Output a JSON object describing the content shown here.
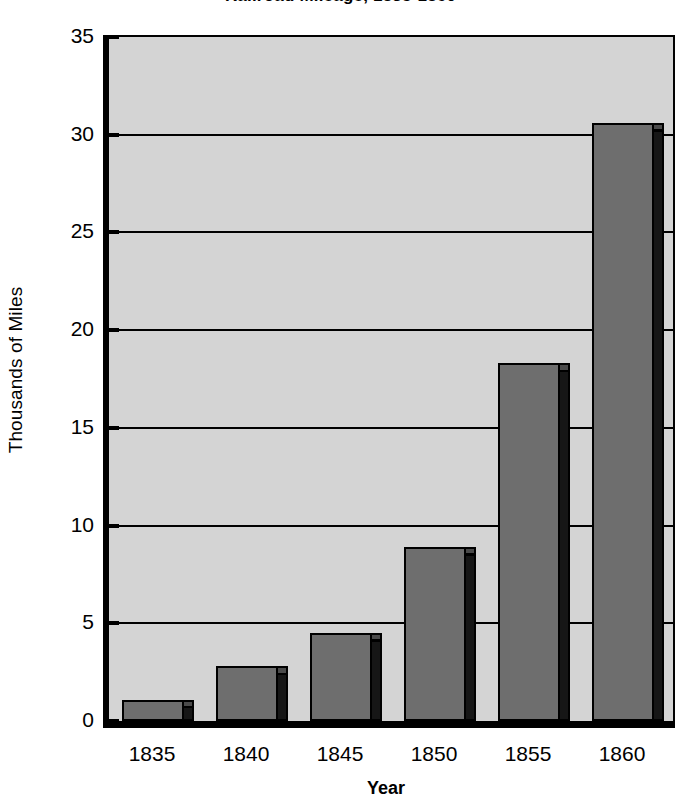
{
  "chart_data": {
    "type": "bar",
    "title": "Railroad Mileage, 1835-1860",
    "xlabel": "Year",
    "ylabel": "Thousands of Miles",
    "categories": [
      "1835",
      "1840",
      "1845",
      "1850",
      "1855",
      "1860"
    ],
    "values": [
      1.1,
      2.8,
      4.5,
      8.9,
      18.3,
      30.6
    ],
    "ylim": [
      0,
      35
    ],
    "yticks": [
      "0",
      "5",
      "10",
      "15",
      "20",
      "25",
      "30",
      "35"
    ],
    "ytick_values": [
      0,
      5,
      10,
      15,
      20,
      25,
      30,
      35
    ],
    "grid": "horizontal",
    "legend": "none",
    "bar_style": "3d-shaded",
    "colors": {
      "bar_face": "#6e6e6e",
      "bar_side": "#161616",
      "bar_top": "#4a4a4a",
      "plot_background": "#d4d4d4",
      "axis": "#000000",
      "page_background": "#ffffff"
    }
  }
}
